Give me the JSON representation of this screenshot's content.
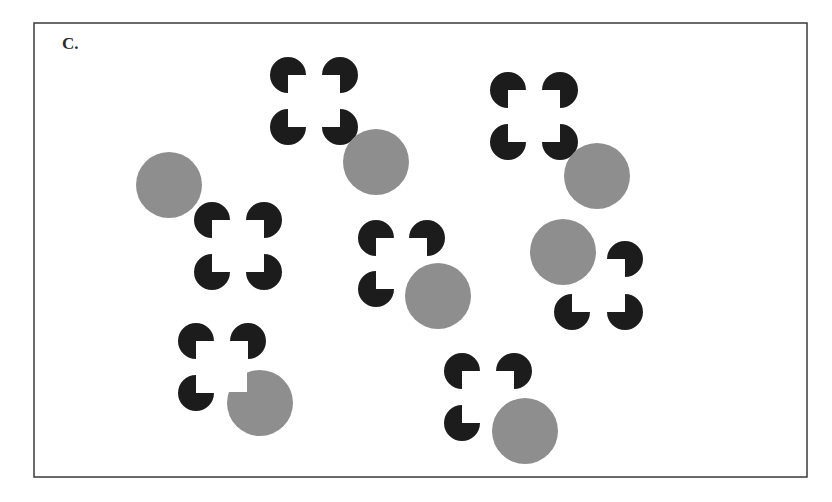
{
  "figure": {
    "panel_label": "C.",
    "frame": {
      "x": 34,
      "y": 23,
      "width": 773,
      "height": 454,
      "stroke": "#3a3a3a"
    },
    "colors": {
      "inducer": "#1c1c1c",
      "disc": "#8e8e8e",
      "background": "#ffffff"
    },
    "inducer_radius": 18,
    "disc_radius": 33,
    "groups": [
      {
        "id": "g1",
        "square": {
          "x": 288,
          "y": 75,
          "size": 52
        },
        "corners": [
          "tl",
          "tr",
          "bl",
          "br"
        ],
        "disc": {
          "cx": 376,
          "cy": 162,
          "notched": false
        }
      },
      {
        "id": "g2",
        "square": {
          "x": 508,
          "y": 90,
          "size": 52
        },
        "corners": [
          "tl",
          "tr",
          "bl",
          "br"
        ],
        "disc": {
          "cx": 597,
          "cy": 176,
          "notched": false
        }
      },
      {
        "id": "g3",
        "square": {
          "x": 212,
          "y": 220,
          "size": 52
        },
        "corners": [
          "tl",
          "tr",
          "bl",
          "br"
        ],
        "disc": {
          "cx": 169,
          "cy": 185,
          "notched": false
        }
      },
      {
        "id": "g4",
        "square": {
          "x": 376,
          "y": 238,
          "size": 51
        },
        "corners": [
          "tl",
          "tr",
          "bl"
        ],
        "disc": {
          "cx": 438,
          "cy": 296,
          "notched": false
        }
      },
      {
        "id": "g5",
        "square": {
          "x": 572,
          "y": 259,
          "size": 53
        },
        "corners": [
          "tr",
          "bl",
          "br"
        ],
        "disc": {
          "cx": 563,
          "cy": 252,
          "notched": false
        }
      },
      {
        "id": "g6",
        "square": {
          "x": 196,
          "y": 341,
          "size": 52
        },
        "corners": [
          "tl",
          "tr",
          "bl"
        ],
        "disc": {
          "cx": 260,
          "cy": 403,
          "notched": true,
          "notch_corner": {
            "x": 247,
            "y": 392
          }
        }
      },
      {
        "id": "g7",
        "square": {
          "x": 462,
          "y": 371,
          "size": 52
        },
        "corners": [
          "tl",
          "tr",
          "bl"
        ],
        "disc": {
          "cx": 525,
          "cy": 431,
          "notched": false
        }
      }
    ]
  }
}
